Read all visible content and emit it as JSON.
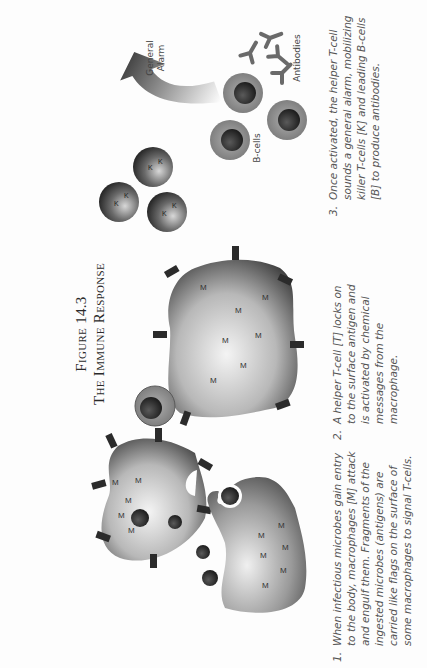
{
  "figure": {
    "number_label": "Figure 14.3",
    "title": "The Immune Response"
  },
  "panels": [
    {
      "number": "1.",
      "caption": "When infectious microbes gain entry to the body, macrophages [M] attack and engulf them. Fragments of the ingested microbes (antigens) are carried like flags on the surface of some macrophages to signal T-cells.",
      "cell_letter": "M"
    },
    {
      "number": "2.",
      "caption": "A helper T-cell [T] locks on to the surface antigen and is activated by chemical messages from the macrophage.",
      "cell_letter": "M"
    },
    {
      "number": "3.",
      "caption": "Once activated, the helper T-cell sounds a general alarm, mobilizing killer T-cells [K] and leading B-cells [B] to produce antibodies.",
      "cell_letter": "K"
    }
  ],
  "labels": {
    "general_alarm_line1": "General",
    "general_alarm_line2": "Alarm",
    "b_cells": "B-cells",
    "antibodies": "Antibodies"
  },
  "colors": {
    "background": "#fdfdfd",
    "text": "#555555",
    "title": "#2a2a2a",
    "cell_dark": "#2b2b2b",
    "cell_mid": "#8a8a8a",
    "cell_light": "#e8e8e8"
  }
}
